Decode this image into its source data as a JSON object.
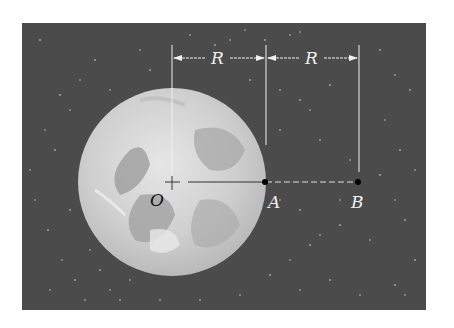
{
  "figure": {
    "colors": {
      "background_page": "#ffffff",
      "space": "#4a4a4a",
      "moon_light": "#d8d8d8",
      "moon_dark": "#a8a8a8",
      "lines": "#f2f2f2",
      "points": "#000000"
    },
    "dimensions": [
      {
        "label": "R",
        "from": "O",
        "to": "A"
      },
      {
        "label": "R",
        "from": "A",
        "to": "B"
      }
    ],
    "points": [
      {
        "label": "O",
        "role": "center"
      },
      {
        "label": "A",
        "role": "surface"
      },
      {
        "label": "B",
        "role": "outside"
      }
    ]
  }
}
